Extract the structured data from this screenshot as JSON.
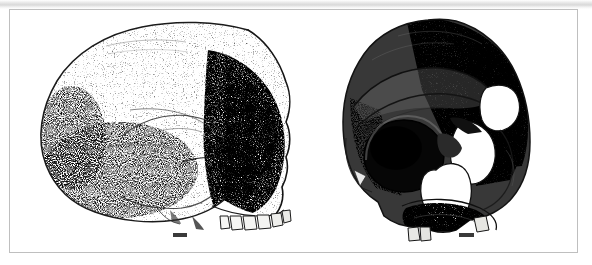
{
  "figure": {
    "background_color": "#ffffff",
    "frame_color": "#bfbfbf",
    "ink_color": "#1a1a1a",
    "panels": [
      {
        "id": "lateral",
        "view_label": "Lateral view of hominin cranium",
        "specimen_name": "skull-lateral-left-facing-right",
        "scale_bar": {
          "label": "scale-bar",
          "width_px": 14
        }
      },
      {
        "id": "frontal",
        "view_label": "Three-quarter frontal view of hominin cranium",
        "specimen_name": "skull-three-quarter-frontal",
        "scale_bar": {
          "label": "scale-bar",
          "width_px": 15
        }
      }
    ]
  }
}
